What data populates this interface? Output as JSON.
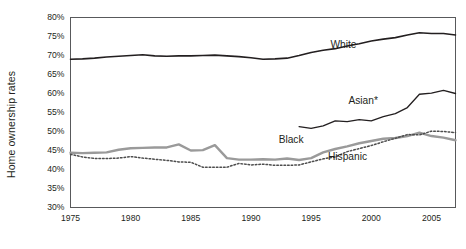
{
  "chart_data": {
    "type": "line",
    "title": "",
    "xlabel": "",
    "ylabel": "Home ownership rates",
    "xlim": [
      1975,
      2007
    ],
    "ylim": [
      30,
      80
    ],
    "grid": false,
    "legend_position": "inline-annotations",
    "xticks": [
      "1975",
      "1980",
      "1985",
      "1990",
      "1995",
      "2000",
      "2005"
    ],
    "xtick_values": [
      1975,
      1980,
      1985,
      1990,
      1995,
      2000,
      2005
    ],
    "yticks": [
      "30%",
      "35%",
      "40%",
      "45%",
      "50%",
      "55%",
      "60%",
      "65%",
      "70%",
      "75%",
      "80%"
    ],
    "ytick_values": [
      30,
      35,
      40,
      45,
      50,
      55,
      60,
      65,
      70,
      75,
      80
    ],
    "series": [
      {
        "name": "White",
        "label": "White",
        "style": "solid",
        "color": "#231f20",
        "width": 1.6,
        "label_x": 1996.6,
        "label_y": 72.6,
        "x": [
          1975,
          1976,
          1977,
          1978,
          1979,
          1980,
          1981,
          1982,
          1983,
          1984,
          1985,
          1986,
          1987,
          1988,
          1989,
          1990,
          1991,
          1992,
          1993,
          1994,
          1995,
          1996,
          1997,
          1998,
          1999,
          2000,
          2001,
          2002,
          2003,
          2004,
          2005,
          2006,
          2007
        ],
        "values": [
          69.0,
          69.1,
          69.3,
          69.6,
          69.8,
          70.0,
          70.2,
          69.9,
          69.8,
          69.9,
          69.9,
          70.0,
          70.1,
          69.9,
          69.7,
          69.4,
          69.0,
          69.1,
          69.3,
          70.0,
          70.8,
          71.4,
          71.8,
          72.5,
          73.1,
          73.8,
          74.3,
          74.7,
          75.4,
          76.0,
          75.8,
          75.8,
          75.4
        ]
      },
      {
        "name": "Asian",
        "label": "Asian*",
        "style": "solid",
        "color": "#231f20",
        "width": 1.3,
        "label_x": 1998.1,
        "label_y": 57.8,
        "x": [
          1994,
          1995,
          1996,
          1997,
          1998,
          1999,
          2000,
          2001,
          2002,
          2003,
          2004,
          2005,
          2006,
          2007
        ],
        "values": [
          51.3,
          50.8,
          51.5,
          52.8,
          52.6,
          53.1,
          52.8,
          53.9,
          54.7,
          56.3,
          59.8,
          60.1,
          60.8,
          60.0
        ]
      },
      {
        "name": "Black",
        "label": "Black",
        "style": "solid",
        "color": "#9a9a9a",
        "width": 2.4,
        "label_x": 1992.3,
        "label_y": 47.6,
        "x": [
          1975,
          1976,
          1977,
          1978,
          1979,
          1980,
          1981,
          1982,
          1983,
          1984,
          1985,
          1986,
          1987,
          1988,
          1989,
          1990,
          1991,
          1992,
          1993,
          1994,
          1995,
          1996,
          1997,
          1998,
          1999,
          2000,
          2001,
          2002,
          2003,
          2004,
          2005,
          2006,
          2007
        ],
        "values": [
          44.4,
          44.3,
          44.4,
          44.5,
          45.2,
          45.6,
          45.7,
          45.8,
          45.8,
          46.6,
          45.0,
          45.1,
          46.4,
          43.0,
          42.6,
          42.6,
          42.7,
          42.6,
          42.9,
          42.5,
          43.0,
          44.5,
          45.4,
          46.1,
          46.9,
          47.5,
          48.1,
          48.3,
          48.8,
          49.7,
          48.8,
          48.4,
          47.7
        ]
      },
      {
        "name": "Hispanic",
        "label": "Hispanic",
        "style": "dotted",
        "color": "#4d4d4d",
        "width": 1.5,
        "label_x": 1996.4,
        "label_y": 43.0,
        "x": [
          1975,
          1976,
          1977,
          1978,
          1979,
          1980,
          1981,
          1982,
          1983,
          1984,
          1985,
          1986,
          1987,
          1988,
          1989,
          1990,
          1991,
          1992,
          1993,
          1994,
          1995,
          1996,
          1997,
          1998,
          1999,
          2000,
          2001,
          2002,
          2003,
          2004,
          2005,
          2006,
          2007
        ],
        "values": [
          44.0,
          43.3,
          42.9,
          42.9,
          43.0,
          43.4,
          43.0,
          42.7,
          42.4,
          42.0,
          41.9,
          40.6,
          40.6,
          40.6,
          41.6,
          41.2,
          41.4,
          41.1,
          41.1,
          41.2,
          42.0,
          42.8,
          43.3,
          44.7,
          45.5,
          46.3,
          47.3,
          48.2,
          49.2,
          49.1,
          50.1,
          50.0,
          49.7
        ]
      }
    ],
    "footnote": ""
  }
}
